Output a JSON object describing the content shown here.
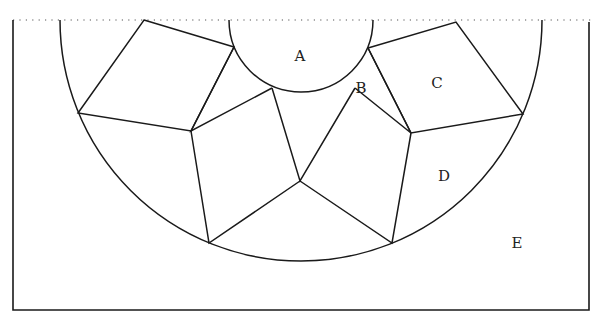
{
  "diagram": {
    "type": "geometric-tessellation",
    "colors": {
      "stroke": "#1a1a1a",
      "background": "#ffffff",
      "dotted_line": "#555555"
    },
    "labels": {
      "A": "A",
      "B": "B",
      "C": "C",
      "D": "D",
      "E": "E"
    },
    "label_positions": {
      "A": [
        300,
        61
      ],
      "B": [
        361,
        93
      ],
      "C": [
        437,
        88
      ],
      "D": [
        444,
        181
      ],
      "E": [
        517,
        248
      ]
    },
    "rectangle": {
      "left": 13,
      "top": 20,
      "right": 589,
      "bottom": 310
    },
    "big_semicircle": {
      "cx": 301,
      "cy": 20,
      "r": 241
    },
    "small_semicircle": {
      "cx": 301,
      "cy": 20,
      "r": 72
    }
  }
}
